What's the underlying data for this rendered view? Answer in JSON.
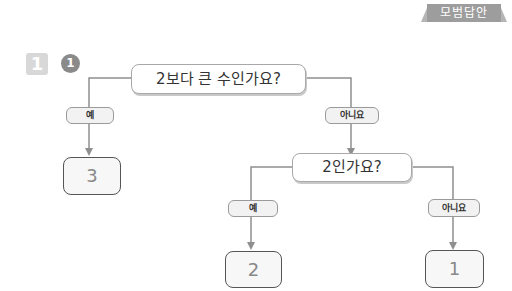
{
  "header": {
    "badge_label": "모범답안"
  },
  "problem": {
    "number": "1",
    "sub_number": "1"
  },
  "diagram": {
    "question1": "2보다 큰 수인가요?",
    "question2": "2인가요?",
    "labels": {
      "yes": "예",
      "no": "아니요"
    },
    "answers": {
      "a1": "3",
      "a2": "2",
      "a3": "1"
    },
    "colors": {
      "line": "#8f8f8f",
      "box_border": "#555555",
      "badge": "#9d9d9d"
    }
  }
}
